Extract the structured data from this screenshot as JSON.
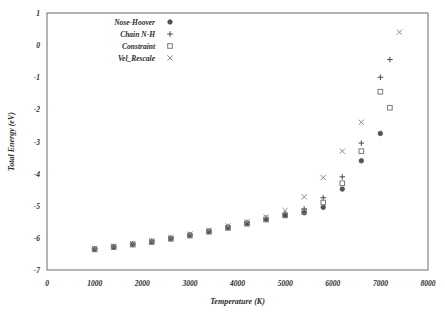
{
  "chart_data": {
    "type": "scatter",
    "title": "",
    "xlabel": "Temperature (K)",
    "ylabel": "Total Energy (eV)",
    "xlim": [
      0,
      8000
    ],
    "ylim": [
      -7,
      1
    ],
    "xticks": [
      0,
      1000,
      2000,
      3000,
      4000,
      5000,
      6000,
      7000,
      8000
    ],
    "yticks": [
      1,
      0,
      -1,
      -2,
      -3,
      -4,
      -5,
      -6,
      -7
    ],
    "xtick_labels": [
      "0",
      "1000",
      "2000",
      "3000",
      "4000",
      "5000",
      "6000",
      "7000",
      "8000"
    ],
    "ytick_labels": [
      "1",
      "0",
      "-1",
      "-2",
      "-3",
      "-4",
      "-5",
      "-6",
      "-7"
    ],
    "grid": false,
    "legend_position": "top-left",
    "series": [
      {
        "name": "Nose-Hoover",
        "marker": "circle",
        "color": "#555555",
        "x": [
          1000,
          1400,
          1800,
          2200,
          2600,
          3000,
          3400,
          3800,
          4200,
          4600,
          5000,
          5400,
          5800,
          6200,
          6600,
          7000
        ],
        "y": [
          -6.35,
          -6.28,
          -6.2,
          -6.12,
          -6.02,
          -5.92,
          -5.8,
          -5.68,
          -5.55,
          -5.42,
          -5.3,
          -5.22,
          -5.05,
          -4.48,
          -3.6,
          -2.75
        ]
      },
      {
        "name": "Chain N-H",
        "marker": "plus",
        "color": "#4a4a4a",
        "x": [
          1000,
          1400,
          1800,
          2200,
          2600,
          3000,
          3400,
          3800,
          4200,
          4600,
          5000,
          5400,
          5800,
          6200,
          6600,
          7000,
          7200
        ],
        "y": [
          -6.34,
          -6.27,
          -6.19,
          -6.1,
          -6.0,
          -5.9,
          -5.78,
          -5.65,
          -5.52,
          -5.38,
          -5.25,
          -5.1,
          -4.75,
          -4.1,
          -3.05,
          -1.0,
          -0.45
        ]
      },
      {
        "name": "Constraint",
        "marker": "square",
        "color": "#7a7a7a",
        "x": [
          1000,
          1400,
          1800,
          2200,
          2600,
          3000,
          3400,
          3800,
          4200,
          4600,
          5000,
          5400,
          5800,
          6200,
          6600,
          7000,
          7200
        ],
        "y": [
          -6.36,
          -6.29,
          -6.21,
          -6.13,
          -6.03,
          -5.93,
          -5.81,
          -5.69,
          -5.56,
          -5.43,
          -5.3,
          -5.18,
          -4.9,
          -4.3,
          -3.3,
          -1.45,
          -1.95
        ]
      },
      {
        "name": "Vel_Rescale",
        "marker": "x",
        "color": "#8a8a8a",
        "x": [
          1000,
          1400,
          1800,
          2200,
          2600,
          3000,
          3400,
          3800,
          4200,
          4600,
          5000,
          5400,
          5800,
          6200,
          6600,
          7400
        ],
        "y": [
          -6.33,
          -6.26,
          -6.18,
          -6.09,
          -5.99,
          -5.88,
          -5.76,
          -5.63,
          -5.5,
          -5.35,
          -5.15,
          -4.72,
          -4.12,
          -3.3,
          -2.4,
          0.4
        ]
      }
    ],
    "legend": [
      {
        "label": "Nose-Hoover",
        "marker": "circle"
      },
      {
        "label": "Chain N-H",
        "marker": "plus"
      },
      {
        "label": "Constraint",
        "marker": "square"
      },
      {
        "label": "Vel_Rescale",
        "marker": "x"
      }
    ]
  }
}
